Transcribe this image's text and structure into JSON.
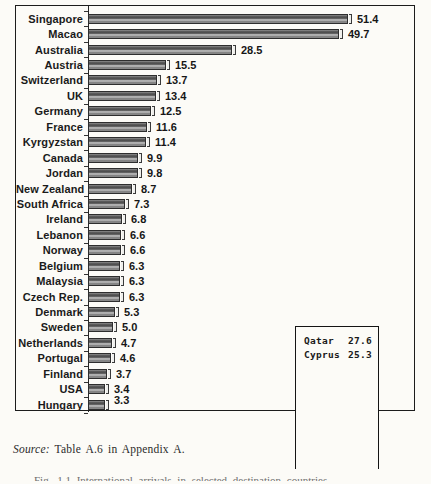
{
  "chart_data": {
    "type": "bar",
    "orientation": "horizontal",
    "title": "",
    "xlabel": "",
    "ylabel": "",
    "axis_scale_shown": false,
    "value_labels_shown": true,
    "value_label_decimals": 1,
    "categories": [
      "Singapore",
      "Macao",
      "Australia",
      "Austria",
      "Switzerland",
      "UK",
      "Germany",
      "France",
      "Kyrgyzstan",
      "Canada",
      "Jordan",
      "New Zealand",
      "South Africa",
      "Ireland",
      "Lebanon",
      "Norway",
      "Belgium",
      "Malaysia",
      "Czech Rep.",
      "Denmark",
      "Sweden",
      "Netherlands",
      "Portugal",
      "Finland",
      "USA",
      "Hungary"
    ],
    "values": [
      51.4,
      49.7,
      28.5,
      15.5,
      13.7,
      13.4,
      12.5,
      11.6,
      11.4,
      9.9,
      9.8,
      8.7,
      7.3,
      6.8,
      6.6,
      6.6,
      6.3,
      6.3,
      6.3,
      5.3,
      5.0,
      4.7,
      4.6,
      3.7,
      3.4,
      3.3
    ],
    "colors": {
      "bar_dark": "#4a4a4a",
      "bar_light": "#c2c2c2",
      "frame_border": "#1c1c1c",
      "paper_background": "#fcfbf7",
      "label_ink": "#1a1a1a"
    },
    "inset_box": {
      "rows": [
        {
          "label": "Qatar",
          "value": "27.6"
        },
        {
          "label": "Cyprus",
          "value": "25.3"
        }
      ]
    }
  },
  "source_note": {
    "prefix": "Source:",
    "text": " Table A.6 in Appendix A."
  },
  "caption_fragment": "Fig. 1.1  International arrivals in selected destination countries"
}
